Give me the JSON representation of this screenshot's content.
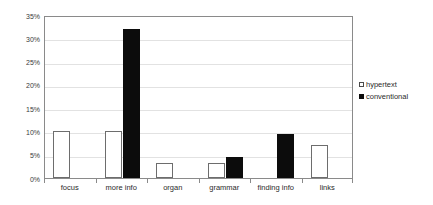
{
  "chart_data": {
    "type": "bar",
    "title": "",
    "subtitle": "",
    "xlabel": "",
    "ylabel": "",
    "categories": [
      "focus",
      "more info",
      "organ",
      "grammar",
      "finding info",
      "links"
    ],
    "series": [
      {
        "name": "hypertext",
        "values": [
          10,
          10,
          3.2,
          3.2,
          0,
          7
        ]
      },
      {
        "name": "conventional",
        "values": [
          0,
          32,
          0,
          4.6,
          9.5,
          0
        ]
      }
    ],
    "ylim": [
      0,
      35
    ],
    "ytick_values": [
      0,
      5,
      10,
      15,
      20,
      25,
      30,
      35
    ],
    "ytick_labels": [
      "0%",
      "5%",
      "10%",
      "15%",
      "20%",
      "25%",
      "30%",
      "35%"
    ],
    "grid": true,
    "grid_axis": "y",
    "legend_position": "right",
    "legend_entries": [
      {
        "label": "hypertext",
        "swatch": "hollow-square",
        "color": "#ffffff"
      },
      {
        "label": "conventional",
        "swatch": "filled-square",
        "color": "#0c0c0c"
      }
    ],
    "colors": {
      "hypertext_fill": "#ffffff",
      "hypertext_stroke": "#6d6d6d",
      "conventional_fill": "#0c0c0c",
      "axis": "#8a8a8a",
      "gridline": "#e2e2e2",
      "text": "#2a2a2a",
      "background": "#ffffff"
    }
  }
}
